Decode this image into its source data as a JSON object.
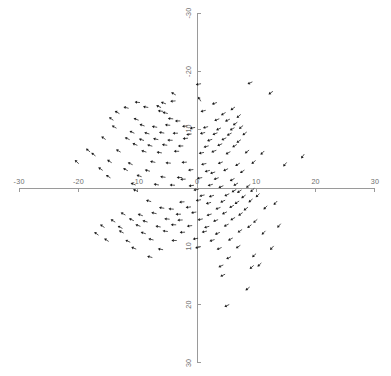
{
  "chart_data": {
    "type": "scatter",
    "title": "",
    "subtitle": "",
    "xlabel": "",
    "ylabel": "",
    "xlim": [
      -33,
      33
    ],
    "ylim": [
      -33,
      33
    ],
    "y_axis_inverted": true,
    "grid": false,
    "legend": null,
    "marker": "arrow-glyph",
    "x_ticks": [
      -30,
      -20,
      -10,
      0,
      10,
      20,
      30
    ],
    "x_tick_labels": [
      "-30",
      "-20",
      "-10",
      "0",
      "10",
      "20",
      "30"
    ],
    "y_ticks": [
      -30,
      -20,
      -10,
      0,
      10,
      20,
      30
    ],
    "y_tick_labels": [
      "-30",
      "-20",
      "-10",
      "0",
      "10",
      "20",
      "30"
    ],
    "axis_color": "#9a9a9a",
    "marker_color": "#1a1a1a",
    "background_color": "#ffffff",
    "point_count": 196,
    "points": [
      {
        "x": 0.2,
        "y": -17.8,
        "angle": 190
      },
      {
        "x": 8.9,
        "y": -18.0,
        "angle": 205
      },
      {
        "x": -4.0,
        "y": -16.2,
        "angle": 150
      },
      {
        "x": 12.4,
        "y": -16.3,
        "angle": 215
      },
      {
        "x": 0.4,
        "y": -15.3,
        "angle": 120
      },
      {
        "x": -10.1,
        "y": -14.7,
        "angle": 175
      },
      {
        "x": -5.7,
        "y": -14.6,
        "angle": 160
      },
      {
        "x": -4.1,
        "y": -14.9,
        "angle": 185
      },
      {
        "x": -12.0,
        "y": -13.8,
        "angle": 165
      },
      {
        "x": -8.7,
        "y": -13.9,
        "angle": 170
      },
      {
        "x": -6.5,
        "y": -14.0,
        "angle": 155
      },
      {
        "x": 2.9,
        "y": -14.5,
        "angle": 200
      },
      {
        "x": 6.0,
        "y": -13.6,
        "angle": 215
      },
      {
        "x": -13.5,
        "y": -13.0,
        "angle": 150
      },
      {
        "x": -6.2,
        "y": -13.2,
        "angle": 175
      },
      {
        "x": -5.4,
        "y": -12.9,
        "angle": 165
      },
      {
        "x": 1.0,
        "y": -13.2,
        "angle": 195
      },
      {
        "x": 4.4,
        "y": -12.7,
        "angle": 210
      },
      {
        "x": 7.0,
        "y": -12.3,
        "angle": 220
      },
      {
        "x": -14.5,
        "y": -11.9,
        "angle": 145
      },
      {
        "x": -10.3,
        "y": -11.8,
        "angle": 160
      },
      {
        "x": -4.5,
        "y": -11.9,
        "angle": 175
      },
      {
        "x": -3.3,
        "y": -11.5,
        "angle": 180
      },
      {
        "x": 3.3,
        "y": -11.7,
        "angle": 200
      },
      {
        "x": 5.1,
        "y": -11.6,
        "angle": 205
      },
      {
        "x": 6.4,
        "y": -11.0,
        "angle": 215
      },
      {
        "x": -14.0,
        "y": -10.5,
        "angle": 150
      },
      {
        "x": -9.3,
        "y": -10.8,
        "angle": 160
      },
      {
        "x": -7.2,
        "y": -10.5,
        "angle": 170
      },
      {
        "x": -5.0,
        "y": -10.8,
        "angle": 175
      },
      {
        "x": -2.1,
        "y": -10.6,
        "angle": 185
      },
      {
        "x": -0.8,
        "y": -10.3,
        "angle": 190
      },
      {
        "x": 1.4,
        "y": -10.4,
        "angle": 195
      },
      {
        "x": 3.6,
        "y": -10.1,
        "angle": 205
      },
      {
        "x": 5.9,
        "y": -10.1,
        "angle": 210
      },
      {
        "x": 7.4,
        "y": -10.4,
        "angle": 220
      },
      {
        "x": -11.0,
        "y": -9.6,
        "angle": 155
      },
      {
        "x": -8.5,
        "y": -9.4,
        "angle": 165
      },
      {
        "x": -6.0,
        "y": -9.5,
        "angle": 170
      },
      {
        "x": -3.7,
        "y": -9.4,
        "angle": 180
      },
      {
        "x": -1.4,
        "y": -9.2,
        "angle": 188
      },
      {
        "x": 0.9,
        "y": -9.4,
        "angle": 195
      },
      {
        "x": 3.0,
        "y": -9.3,
        "angle": 200
      },
      {
        "x": 5.4,
        "y": -9.2,
        "angle": 208
      },
      {
        "x": 8.0,
        "y": -9.3,
        "angle": 218
      },
      {
        "x": -15.8,
        "y": -8.6,
        "angle": 145
      },
      {
        "x": -11.8,
        "y": -8.5,
        "angle": 155
      },
      {
        "x": -9.4,
        "y": -8.3,
        "angle": 162
      },
      {
        "x": -7.0,
        "y": -8.4,
        "angle": 168
      },
      {
        "x": -4.6,
        "y": -8.2,
        "angle": 178
      },
      {
        "x": -2.0,
        "y": -8.5,
        "angle": 185
      },
      {
        "x": 2.1,
        "y": -8.2,
        "angle": 198
      },
      {
        "x": 4.5,
        "y": -8.4,
        "angle": 205
      },
      {
        "x": 7.0,
        "y": -8.0,
        "angle": 215
      },
      {
        "x": -10.5,
        "y": -7.5,
        "angle": 158
      },
      {
        "x": -8.0,
        "y": -7.3,
        "angle": 165
      },
      {
        "x": -5.5,
        "y": -7.4,
        "angle": 172
      },
      {
        "x": -2.8,
        "y": -7.2,
        "angle": 182
      },
      {
        "x": 1.5,
        "y": -7.1,
        "angle": 196
      },
      {
        "x": 3.8,
        "y": -7.4,
        "angle": 203
      },
      {
        "x": 6.3,
        "y": -7.2,
        "angle": 212
      },
      {
        "x": -18.4,
        "y": -6.5,
        "angle": 140
      },
      {
        "x": -17.5,
        "y": -5.8,
        "angle": 142
      },
      {
        "x": -13.3,
        "y": -6.4,
        "angle": 150
      },
      {
        "x": -9.0,
        "y": -6.3,
        "angle": 163
      },
      {
        "x": -6.4,
        "y": -6.1,
        "angle": 170
      },
      {
        "x": -3.5,
        "y": -6.3,
        "angle": 180
      },
      {
        "x": 0.7,
        "y": -6.0,
        "angle": 192
      },
      {
        "x": 2.8,
        "y": -6.3,
        "angle": 200
      },
      {
        "x": 5.2,
        "y": -6.0,
        "angle": 208
      },
      {
        "x": 8.4,
        "y": -6.2,
        "angle": 218
      },
      {
        "x": 11.0,
        "y": -6.0,
        "angle": 225
      },
      {
        "x": 17.8,
        "y": -5.4,
        "angle": 235
      },
      {
        "x": -20.3,
        "y": -4.5,
        "angle": 138
      },
      {
        "x": -14.8,
        "y": -4.6,
        "angle": 148
      },
      {
        "x": -11.3,
        "y": -4.2,
        "angle": 155
      },
      {
        "x": -7.5,
        "y": -4.5,
        "angle": 167
      },
      {
        "x": -4.9,
        "y": -4.3,
        "angle": 175
      },
      {
        "x": -2.2,
        "y": -4.4,
        "angle": 185
      },
      {
        "x": 1.1,
        "y": -4.1,
        "angle": 193
      },
      {
        "x": 3.9,
        "y": -4.3,
        "angle": 202
      },
      {
        "x": 6.8,
        "y": -4.0,
        "angle": 212
      },
      {
        "x": 9.5,
        "y": -4.4,
        "angle": 220
      },
      {
        "x": 14.8,
        "y": -4.0,
        "angle": 230
      },
      {
        "x": -16.3,
        "y": -3.3,
        "angle": 145
      },
      {
        "x": -12.1,
        "y": -3.2,
        "angle": 152
      },
      {
        "x": -8.4,
        "y": -3.0,
        "angle": 165
      },
      {
        "x": -1.1,
        "y": -3.1,
        "angle": 188
      },
      {
        "x": 1.7,
        "y": -2.9,
        "angle": 195
      },
      {
        "x": 2.6,
        "y": -2.6,
        "angle": 198
      },
      {
        "x": 4.8,
        "y": -3.1,
        "angle": 206
      },
      {
        "x": 7.6,
        "y": -2.8,
        "angle": 214
      },
      {
        "x": -15.0,
        "y": -2.0,
        "angle": 147
      },
      {
        "x": -9.8,
        "y": -2.1,
        "angle": 160
      },
      {
        "x": -5.8,
        "y": -1.9,
        "angle": 172
      },
      {
        "x": -3.0,
        "y": -1.8,
        "angle": 180
      },
      {
        "x": -2.4,
        "y": -1.5,
        "angle": 183
      },
      {
        "x": 0.4,
        "y": -1.7,
        "angle": 190
      },
      {
        "x": 3.2,
        "y": -1.6,
        "angle": 200
      },
      {
        "x": 5.9,
        "y": -1.4,
        "angle": 209
      },
      {
        "x": -10.8,
        "y": -0.7,
        "angle": 158
      },
      {
        "x": -6.9,
        "y": -0.6,
        "angle": 170
      },
      {
        "x": -4.2,
        "y": -0.5,
        "angle": 177
      },
      {
        "x": -1.0,
        "y": -0.4,
        "angle": 188
      },
      {
        "x": 2.2,
        "y": -0.5,
        "angle": 197
      },
      {
        "x": 4.0,
        "y": -0.2,
        "angle": 203
      },
      {
        "x": 6.5,
        "y": -0.6,
        "angle": 211
      },
      {
        "x": 8.6,
        "y": -0.3,
        "angle": 219
      },
      {
        "x": -10.4,
        "y": 0.4,
        "angle": 157
      },
      {
        "x": -0.2,
        "y": 0.3,
        "angle": 190
      },
      {
        "x": 6.2,
        "y": 0.5,
        "angle": 210
      },
      {
        "x": 7.1,
        "y": 0.6,
        "angle": 214
      },
      {
        "x": 9.3,
        "y": 0.4,
        "angle": 222
      },
      {
        "x": 0.8,
        "y": 1.3,
        "angle": 193
      },
      {
        "x": 2.4,
        "y": 1.4,
        "angle": 198
      },
      {
        "x": 5.0,
        "y": 1.2,
        "angle": 206
      },
      {
        "x": 7.8,
        "y": 1.5,
        "angle": 216
      },
      {
        "x": 10.2,
        "y": 1.3,
        "angle": 224
      },
      {
        "x": -8.2,
        "y": 2.2,
        "angle": 164
      },
      {
        "x": -2.6,
        "y": 2.4,
        "angle": 184
      },
      {
        "x": 0.2,
        "y": 2.1,
        "angle": 191
      },
      {
        "x": 1.9,
        "y": 2.6,
        "angle": 196
      },
      {
        "x": 4.3,
        "y": 2.3,
        "angle": 204
      },
      {
        "x": 6.7,
        "y": 2.5,
        "angle": 212
      },
      {
        "x": 9.0,
        "y": 2.2,
        "angle": 220
      },
      {
        "x": 13.2,
        "y": 2.6,
        "angle": 228
      },
      {
        "x": -6.0,
        "y": 3.4,
        "angle": 171
      },
      {
        "x": -4.4,
        "y": 3.6,
        "angle": 176
      },
      {
        "x": -1.5,
        "y": 3.3,
        "angle": 187
      },
      {
        "x": 3.5,
        "y": 3.5,
        "angle": 201
      },
      {
        "x": 5.8,
        "y": 3.2,
        "angle": 209
      },
      {
        "x": 8.2,
        "y": 3.6,
        "angle": 217
      },
      {
        "x": 11.5,
        "y": 3.4,
        "angle": 226
      },
      {
        "x": -12.5,
        "y": 4.4,
        "angle": 151
      },
      {
        "x": -9.6,
        "y": 4.6,
        "angle": 161
      },
      {
        "x": -7.3,
        "y": 4.3,
        "angle": 168
      },
      {
        "x": -3.2,
        "y": 4.5,
        "angle": 181
      },
      {
        "x": -0.6,
        "y": 4.2,
        "angle": 189
      },
      {
        "x": 2.0,
        "y": 4.6,
        "angle": 197
      },
      {
        "x": 4.6,
        "y": 4.3,
        "angle": 205
      },
      {
        "x": 7.3,
        "y": 4.5,
        "angle": 215
      },
      {
        "x": -14.2,
        "y": 5.6,
        "angle": 149
      },
      {
        "x": -11.1,
        "y": 5.4,
        "angle": 156
      },
      {
        "x": -8.8,
        "y": 5.7,
        "angle": 163
      },
      {
        "x": -5.1,
        "y": 5.3,
        "angle": 174
      },
      {
        "x": -2.9,
        "y": 5.5,
        "angle": 182
      },
      {
        "x": 0.5,
        "y": 5.4,
        "angle": 192
      },
      {
        "x": 3.1,
        "y": 5.6,
        "angle": 200
      },
      {
        "x": 6.0,
        "y": 5.3,
        "angle": 210
      },
      {
        "x": 9.8,
        "y": 5.7,
        "angle": 221
      },
      {
        "x": -16.0,
        "y": 6.5,
        "angle": 146
      },
      {
        "x": -13.0,
        "y": 6.7,
        "angle": 152
      },
      {
        "x": -10.0,
        "y": 6.4,
        "angle": 159
      },
      {
        "x": -6.6,
        "y": 6.6,
        "angle": 169
      },
      {
        "x": -4.0,
        "y": 6.3,
        "angle": 178
      },
      {
        "x": -1.3,
        "y": 6.5,
        "angle": 186
      },
      {
        "x": 1.6,
        "y": 6.7,
        "angle": 195
      },
      {
        "x": 4.9,
        "y": 6.4,
        "angle": 206
      },
      {
        "x": 8.8,
        "y": 6.6,
        "angle": 218
      },
      {
        "x": 13.8,
        "y": 6.5,
        "angle": 229
      },
      {
        "x": -17.0,
        "y": 7.8,
        "angle": 143
      },
      {
        "x": -12.8,
        "y": 7.5,
        "angle": 153
      },
      {
        "x": -9.1,
        "y": 7.7,
        "angle": 162
      },
      {
        "x": -5.4,
        "y": 7.4,
        "angle": 173
      },
      {
        "x": -2.5,
        "y": 7.6,
        "angle": 183
      },
      {
        "x": 1.2,
        "y": 7.5,
        "angle": 194
      },
      {
        "x": 3.4,
        "y": 7.8,
        "angle": 202
      },
      {
        "x": 7.2,
        "y": 7.4,
        "angle": 214
      },
      {
        "x": 11.2,
        "y": 7.7,
        "angle": 225
      },
      {
        "x": -15.3,
        "y": 8.9,
        "angle": 147
      },
      {
        "x": -11.7,
        "y": 9.1,
        "angle": 155
      },
      {
        "x": -7.8,
        "y": 8.8,
        "angle": 166
      },
      {
        "x": -3.9,
        "y": 9.0,
        "angle": 179
      },
      {
        "x": -0.3,
        "y": 8.7,
        "angle": 190
      },
      {
        "x": 2.5,
        "y": 9.0,
        "angle": 199
      },
      {
        "x": 5.6,
        "y": 8.8,
        "angle": 208
      },
      {
        "x": -10.7,
        "y": 10.3,
        "angle": 158
      },
      {
        "x": -6.2,
        "y": 10.5,
        "angle": 170
      },
      {
        "x": 0.1,
        "y": 10.2,
        "angle": 191
      },
      {
        "x": 3.7,
        "y": 10.4,
        "angle": 203
      },
      {
        "x": 6.9,
        "y": 10.1,
        "angle": 213
      },
      {
        "x": 12.6,
        "y": 10.3,
        "angle": 227
      },
      {
        "x": -8.0,
        "y": 11.8,
        "angle": 165
      },
      {
        "x": 5.3,
        "y": 12.0,
        "angle": 207
      },
      {
        "x": 9.6,
        "y": 11.6,
        "angle": 223
      },
      {
        "x": 4.0,
        "y": 13.4,
        "angle": 204
      },
      {
        "x": 9.2,
        "y": 13.6,
        "angle": 221
      },
      {
        "x": 10.5,
        "y": 13.2,
        "angle": 224
      },
      {
        "x": 4.3,
        "y": 15.0,
        "angle": 205
      },
      {
        "x": 8.5,
        "y": 17.3,
        "angle": 219
      },
      {
        "x": 5.0,
        "y": 20.2,
        "angle": 206
      }
    ]
  }
}
